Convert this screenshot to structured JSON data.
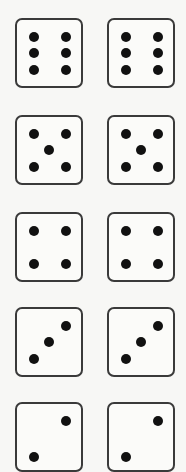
{
  "rows": [
    {
      "label": "pair-of-sixes",
      "faces": [
        6,
        6
      ]
    },
    {
      "label": "pair-of-fives",
      "faces": [
        5,
        5
      ]
    },
    {
      "label": "pair-of-fours",
      "faces": [
        4,
        4
      ]
    },
    {
      "label": "pair-of-threes",
      "faces": [
        3,
        3
      ]
    },
    {
      "label": "pair-of-twos",
      "faces": [
        2,
        2
      ]
    }
  ],
  "colors": {
    "pip": "#111111",
    "border": "#3a3a3a",
    "face": "#fbfbf9",
    "background": "#f7f7f5"
  }
}
